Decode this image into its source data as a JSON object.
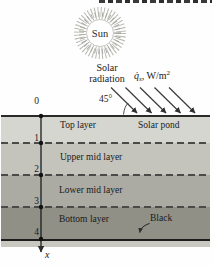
{
  "figure": {
    "sun_label": "Sun",
    "solar_radiation_line1": "Solar",
    "solar_radiation_line2": "radiation",
    "heat_flux": {
      "symbol": "q̇",
      "subscript": "s",
      "rest": ", W/m",
      "exponent": "2"
    },
    "incidence_angle": "45°",
    "solar_pond_label": "Solar pond",
    "black_label": "Black",
    "axis_x_label": "x"
  },
  "axis": {
    "ticks": [
      "0",
      "1",
      "2",
      "3",
      "4"
    ]
  },
  "layers": [
    {
      "name": "Top layer",
      "color": "#d6d6d0"
    },
    {
      "name": "Upper mid layer",
      "color": "#c4c4bd"
    },
    {
      "name": "Lower mid layer",
      "color": "#ababa3"
    },
    {
      "name": "Bottom layer",
      "color": "#909087"
    }
  ],
  "colors": {
    "sub_strip": "#c8c8c1",
    "line_dark": "#2a2a2a",
    "arrow": "#3a3a3a",
    "dashed_boundary": "#4a4a48",
    "sun_corona": "#b4b4ac"
  }
}
